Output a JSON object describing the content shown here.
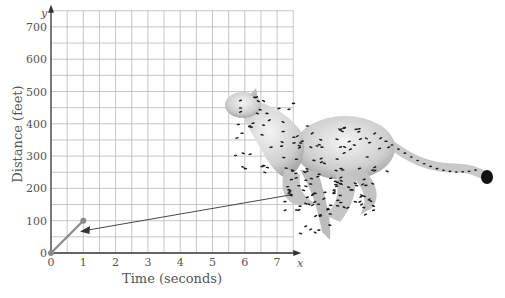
{
  "chart_data": {
    "type": "line",
    "title": "",
    "xlabel": "Time (seconds)",
    "ylabel": "Distance (feet)",
    "x_axis_letter": "x",
    "y_axis_letter": "y",
    "xlim": [
      0,
      7.5
    ],
    "ylim": [
      0,
      750
    ],
    "x_ticks": [
      "0",
      "1",
      "2",
      "3",
      "4",
      "5",
      "6",
      "7"
    ],
    "y_ticks": [
      "0",
      "100",
      "200",
      "300",
      "400",
      "500",
      "600",
      "700"
    ],
    "grid": true,
    "grid_step_x": 0.5,
    "grid_step_y": 50,
    "series": [
      {
        "name": "Cheetah distance",
        "x": [
          0,
          1
        ],
        "y": [
          0,
          100
        ],
        "color": "#8a8a8a"
      }
    ],
    "annotations": [
      {
        "type": "arrow",
        "from_description": "cheetah illustration",
        "to": [
          1.05,
          70
        ]
      },
      {
        "type": "image",
        "description": "running cheetah illustration"
      }
    ],
    "legend": "none"
  },
  "colors": {
    "grid": "#b8b8b8",
    "axis": "#333333",
    "series": "#8a8a8a",
    "text": "#555555"
  }
}
